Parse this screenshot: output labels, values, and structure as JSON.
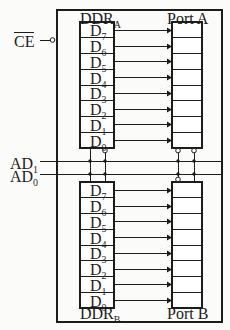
{
  "figure": {
    "type": "block-diagram",
    "background_color": "#fbfbf9",
    "line_color": "#1c1c1c"
  },
  "outer_frame": {
    "x": 57,
    "y": 10,
    "width": 165,
    "height": 312
  },
  "signals": [
    {
      "id": "ce",
      "label": "CE",
      "overline": true,
      "subscript": "",
      "x": 14,
      "y": 44,
      "wire_y": 40,
      "wire_x1": 40,
      "wire_x2": 57,
      "terminal": "open-bubble"
    },
    {
      "id": "ad1",
      "label": "AD",
      "overline": false,
      "subscript": "1",
      "x": 10,
      "y": 155,
      "wire_y": 161,
      "wire_x1": 40,
      "wire_x2": 222,
      "terminal": "none"
    },
    {
      "id": "ad0",
      "label": "AD",
      "overline": false,
      "subscript": "0",
      "x": 10,
      "y": 168,
      "wire_y": 174,
      "wire_x1": 40,
      "wire_x2": 222,
      "terminal": "none"
    }
  ],
  "blocks": [
    {
      "id": "ddr-a",
      "label": "DDR",
      "subscript": "A",
      "label_position": "top",
      "label_x": 80,
      "label_y": 10,
      "x": 80,
      "y": 22,
      "width": 34,
      "height": 126,
      "cells": [
        "D7",
        "D6",
        "D5",
        "D4",
        "D3",
        "D2",
        "D1",
        "D0"
      ],
      "cell_labels": [
        {
          "base": "D",
          "sub": "7"
        },
        {
          "base": "D",
          "sub": "6"
        },
        {
          "base": "D",
          "sub": "5"
        },
        {
          "base": "D",
          "sub": "4"
        },
        {
          "base": "D",
          "sub": "3"
        },
        {
          "base": "D",
          "sub": "2"
        },
        {
          "base": "D",
          "sub": "1"
        },
        {
          "base": "D",
          "sub": "0"
        }
      ]
    },
    {
      "id": "port-a",
      "label": "Port A",
      "subscript": "",
      "label_position": "top",
      "label_x": 167,
      "label_y": 10,
      "x": 172,
      "y": 22,
      "width": 30,
      "height": 126,
      "cells": [
        "",
        "",
        "",
        "",
        "",
        "",
        "",
        ""
      ],
      "cell_labels": []
    },
    {
      "id": "ddr-b",
      "label": "DDR",
      "subscript": "B",
      "label_position": "bottom",
      "label_x": 80,
      "label_y": 305,
      "x": 80,
      "y": 182,
      "width": 34,
      "height": 126,
      "cells": [
        "D7",
        "D6",
        "D5",
        "D4",
        "D3",
        "D2",
        "D1",
        "D0"
      ],
      "cell_labels": [
        {
          "base": "D",
          "sub": "7"
        },
        {
          "base": "D",
          "sub": "6"
        },
        {
          "base": "D",
          "sub": "5"
        },
        {
          "base": "D",
          "sub": "4"
        },
        {
          "base": "D",
          "sub": "3"
        },
        {
          "base": "D",
          "sub": "2"
        },
        {
          "base": "D",
          "sub": "1"
        },
        {
          "base": "D",
          "sub": "0"
        }
      ]
    },
    {
      "id": "port-b",
      "label": "Port B",
      "subscript": "",
      "label_position": "bottom",
      "label_x": 167,
      "label_y": 305,
      "x": 172,
      "y": 182,
      "width": 30,
      "height": 126,
      "cells": [
        "",
        "",
        "",
        "",
        "",
        "",
        "",
        ""
      ],
      "cell_labels": []
    }
  ],
  "arrows": {
    "count_per_block": 8,
    "direction": "right",
    "from_block": "ddr",
    "to_block": "port",
    "head_style": "solid-triangle",
    "x_start": 114,
    "x_end": 172
  },
  "connectors": [
    {
      "id": "ddr-bus-left",
      "x": 90,
      "y1": 148,
      "y2": 182,
      "bubble_at": "none"
    },
    {
      "id": "ddr-bus-right",
      "x": 105,
      "y1": 148,
      "y2": 182,
      "bubble_at": "top"
    },
    {
      "id": "port-bus-left",
      "x": 178,
      "y1": 148,
      "y2": 182,
      "bubble_at": "both"
    },
    {
      "id": "port-bus-right",
      "x": 194,
      "y1": 148,
      "y2": 182,
      "bubble_at": "top"
    }
  ],
  "junction_dots": [
    {
      "x": 90,
      "y": 161
    },
    {
      "x": 90,
      "y": 174
    },
    {
      "x": 105,
      "y": 161
    },
    {
      "x": 105,
      "y": 174
    },
    {
      "x": 178,
      "y": 161
    },
    {
      "x": 178,
      "y": 174
    },
    {
      "x": 194,
      "y": 161
    },
    {
      "x": 194,
      "y": 174
    }
  ]
}
